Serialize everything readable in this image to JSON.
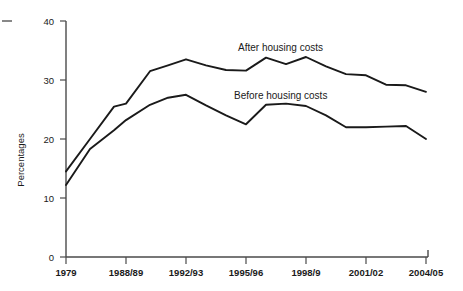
{
  "chart_data": {
    "type": "line",
    "title": "",
    "subtitle": "",
    "xlabel": "",
    "ylabel": "Percentages",
    "ylim": [
      0,
      40
    ],
    "yticks": [
      0,
      10,
      20,
      30,
      40
    ],
    "ytick_labels": [
      "0",
      "10",
      "20",
      "30",
      "40"
    ],
    "grid": false,
    "legend_position": "inline-annotations",
    "x": [
      "1979",
      "1981",
      "1987",
      "1988/89",
      "1990/91",
      "1991/92",
      "1992/93",
      "1993/94",
      "1994/95",
      "1995/96",
      "1996/97",
      "1997/98",
      "1998/9",
      "1999/00",
      "2000/01",
      "2001/02",
      "2002/03",
      "2003/04",
      "2004/05"
    ],
    "xticks": [
      "1979",
      "1988/89",
      "1992/93",
      "1995/96",
      "1998/9",
      "2001/02",
      "2004/05"
    ],
    "xtick_labels": [
      "1979",
      "1988/89",
      "1992/93",
      "1995/96",
      "1998/9",
      "2001/02",
      "2004/05"
    ],
    "series": [
      {
        "name": "After housing costs",
        "label": "After housing costs",
        "color": "#1a1a1a",
        "values": [
          14.5,
          20.0,
          25.5,
          26.0,
          31.5,
          32.5,
          33.5,
          32.5,
          31.7,
          31.6,
          33.8,
          32.7,
          33.9,
          32.3,
          31.0,
          30.8,
          29.2,
          29.1,
          28.0
        ]
      },
      {
        "name": "Before housing costs",
        "label": "Before housing costs",
        "color": "#1a1a1a",
        "values": [
          12.2,
          18.3,
          21.5,
          23.2,
          25.8,
          27.0,
          27.5,
          25.7,
          24.0,
          22.5,
          25.8,
          26.0,
          25.6,
          24.0,
          22.0,
          22.0,
          22.1,
          22.2,
          20.0
        ]
      }
    ],
    "annotations": [
      {
        "name": "after-housing-costs-label",
        "text": "After housing costs"
      },
      {
        "name": "before-housing-costs-label",
        "text": "Before housing costs"
      }
    ]
  }
}
